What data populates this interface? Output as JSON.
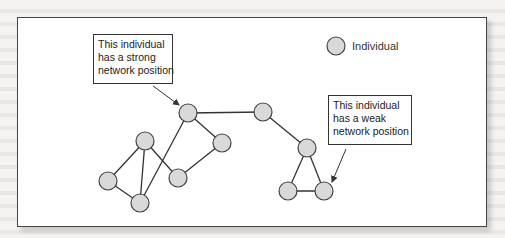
{
  "legend": {
    "symbol": "gray-circle",
    "label": "Individual"
  },
  "callouts": {
    "strong": {
      "lines": [
        "This individual",
        "has a strong",
        "network position"
      ]
    },
    "weak": {
      "lines": [
        "This individual",
        "has a weak",
        "network position"
      ]
    }
  },
  "colors": {
    "node_fill": "#d9d9d9",
    "node_stroke": "#444444",
    "edge": "#333333",
    "frame": "#444444"
  },
  "network": {
    "nodes": [
      {
        "id": "n1",
        "x": 188,
        "y": 113,
        "role": "strong"
      },
      {
        "id": "n2",
        "x": 263,
        "y": 112
      },
      {
        "id": "n3",
        "x": 222,
        "y": 143
      },
      {
        "id": "n4",
        "x": 145,
        "y": 141
      },
      {
        "id": "n5",
        "x": 178,
        "y": 178
      },
      {
        "id": "n6",
        "x": 108,
        "y": 181
      },
      {
        "id": "n7",
        "x": 140,
        "y": 203
      },
      {
        "id": "n8",
        "x": 307,
        "y": 148
      },
      {
        "id": "n9",
        "x": 288,
        "y": 191
      },
      {
        "id": "n10",
        "x": 324,
        "y": 191,
        "role": "weak"
      }
    ],
    "edges": [
      [
        "n1",
        "n2"
      ],
      [
        "n1",
        "n3"
      ],
      [
        "n1",
        "n7"
      ],
      [
        "n4",
        "n6"
      ],
      [
        "n4",
        "n7"
      ],
      [
        "n4",
        "n5"
      ],
      [
        "n5",
        "n3"
      ],
      [
        "n6",
        "n7"
      ],
      [
        "n2",
        "n8"
      ],
      [
        "n8",
        "n9"
      ],
      [
        "n8",
        "n10"
      ],
      [
        "n9",
        "n10"
      ]
    ]
  }
}
